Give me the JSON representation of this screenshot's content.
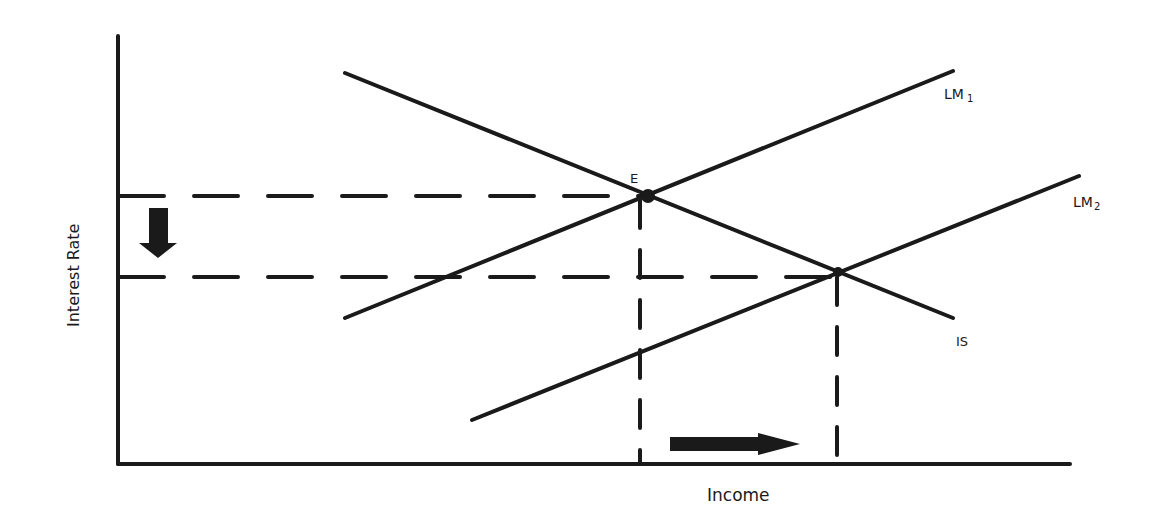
{
  "diagram": {
    "type": "IS-LM monetary expansion",
    "axes": {
      "x_label": "Income",
      "y_label": "Interest Rate"
    },
    "curves": {
      "is": {
        "label": "IS"
      },
      "lm1": {
        "label": "LM",
        "sub": "1"
      },
      "lm2": {
        "label": "LM",
        "sub": "2"
      }
    },
    "points": {
      "e": {
        "label": "E"
      }
    },
    "annotations": {
      "rate_arrow": "down",
      "income_arrow": "right"
    },
    "colors": {
      "line": "#1a1a1a",
      "background": "#ffffff"
    }
  }
}
